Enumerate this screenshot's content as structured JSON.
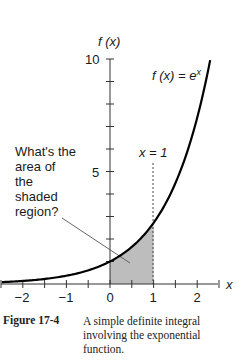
{
  "chart_data": {
    "type": "line",
    "title": "",
    "function": "f(x) = e^x",
    "xlabel": "x",
    "ylabel": "f (x)",
    "xlim": [
      -2.5,
      2.5
    ],
    "ylim": [
      0,
      10
    ],
    "x_ticks": [
      -2.5,
      -2,
      -1.5,
      -1,
      -0.5,
      0,
      0.5,
      1,
      1.5,
      2,
      2.5
    ],
    "x_tick_labels": [
      "−2",
      "−1",
      "0",
      "1",
      "2"
    ],
    "x_tick_label_values": [
      -2,
      -1,
      0,
      1,
      2
    ],
    "y_ticks": [
      1,
      2,
      3,
      4,
      5,
      6,
      7,
      8,
      9,
      10
    ],
    "y_tick_labels": [
      "5",
      "10"
    ],
    "y_tick_label_values": [
      5,
      10
    ],
    "grid": false,
    "series": [
      {
        "name": "f(x) = e^x",
        "x": [
          -2.5,
          -2,
          -1.5,
          -1,
          -0.5,
          0,
          0.5,
          1,
          1.5,
          2,
          2.3
        ],
        "y": [
          0.082,
          0.135,
          0.223,
          0.368,
          0.607,
          1.0,
          1.649,
          2.718,
          4.482,
          7.389,
          9.974
        ]
      }
    ],
    "shaded_region": {
      "from_x": 0,
      "to_x": 1,
      "under": "f(x) = e^x",
      "color": "#bdbdbd"
    },
    "annotations": [
      {
        "text": "f (x) = e",
        "superscript": "x",
        "kind": "curve-label"
      },
      {
        "text": "x = 1",
        "kind": "vertical-dashed-line",
        "x": 1
      },
      {
        "text": "What's the area of the shaded region?",
        "kind": "callout"
      }
    ]
  },
  "labels": {
    "y_axis": "f (x)",
    "x_axis": "x",
    "curve_base": "f (x) = e",
    "curve_sup": "x",
    "vline": "x = 1",
    "callout_lines": [
      "What's the",
      "area of",
      "the",
      "shaded",
      "region?"
    ],
    "y5": "5",
    "y10": "10",
    "xm2": "−2",
    "xm1": "−1",
    "x0": "0",
    "x1": "1",
    "x2": "2"
  },
  "caption": {
    "figure": "Figure 17-4",
    "text": "A simple definite integral involving the exponential function."
  }
}
